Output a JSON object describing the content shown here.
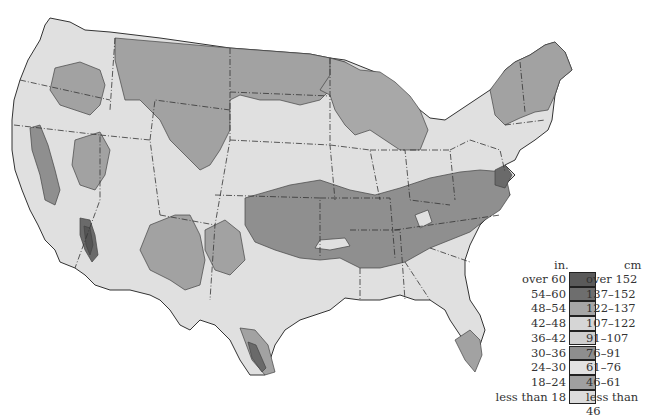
{
  "map": {
    "subject": "United States (contiguous) zoned by value ranges",
    "regions_note": "Choropleth with state boundaries (dash-dot) and shaded zones"
  },
  "legend": {
    "header_in": "in.",
    "header_cm": "cm",
    "classes": [
      {
        "in": "over 60",
        "cm": "over 152",
        "color": "#5a5a5a"
      },
      {
        "in": "54–60",
        "cm": "137–152",
        "color": "#6e6e6e"
      },
      {
        "in": "48–54",
        "cm": "122–137",
        "color": "#a6a6a6"
      },
      {
        "in": "42–48",
        "cm": "107–122",
        "color": "#d6d6d6"
      },
      {
        "in": "36–42",
        "cm": "91–107",
        "color": "#cfcfcf"
      },
      {
        "in": "30–36",
        "cm": "76–91",
        "color": "#8e8e8e"
      },
      {
        "in": "24–30",
        "cm": "61–76",
        "color": "#e2e2e2"
      },
      {
        "in": "18–24",
        "cm": "46–61",
        "color": "#a0a0a0"
      },
      {
        "in": "less than 18",
        "cm": "less than 46",
        "color": "#dcdcdc"
      }
    ]
  },
  "colors": {
    "light": "#e0e0e0",
    "mid": "#a2a2a2",
    "mid2": "#8f8f8f",
    "dark": "#6a6a6a",
    "darkest": "#555555",
    "border": "#333333"
  }
}
